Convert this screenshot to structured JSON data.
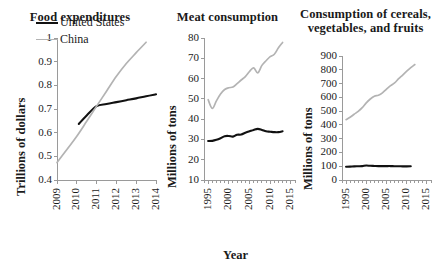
{
  "figure": {
    "background": "#ffffff",
    "series_colors": {
      "united_states": "#111111",
      "china": "#b3b3b3"
    }
  },
  "legend": {
    "position": "inside-panel-1-top-left",
    "entries": [
      {
        "label": "United States",
        "color": "#111111"
      },
      {
        "label": "China",
        "color": "#b3b3b3"
      }
    ]
  },
  "chart_data": [
    {
      "type": "line",
      "title": "Food expenditures",
      "xlabel": "",
      "ylabel": "Trillions of dollars",
      "xlim": [
        2009,
        2014
      ],
      "ylim": [
        0.4,
        1
      ],
      "xticks": [
        "2009",
        "2010",
        "2011",
        "2012",
        "2013",
        "2014"
      ],
      "yticks": [
        "0.4",
        "0.5",
        "0.6",
        "0.7",
        "0.8",
        "0.9",
        "1"
      ],
      "grid": false,
      "legend_position": "upper left",
      "series": [
        {
          "name": "United States",
          "color": "#111111",
          "x": [
            2010.1,
            2010.5,
            2011.0,
            2011.5,
            2012.0,
            2012.5,
            2013.0,
            2013.5,
            2014.0
          ],
          "values": [
            0.637,
            0.673,
            0.712,
            0.721,
            0.729,
            0.737,
            0.745,
            0.754,
            0.762
          ]
        },
        {
          "name": "China",
          "color": "#b3b3b3",
          "x": [
            2009.0,
            2009.5,
            2010.0,
            2010.5,
            2011.0,
            2011.5,
            2012.0,
            2012.5,
            2013.0,
            2013.5
          ],
          "values": [
            0.474,
            0.529,
            0.585,
            0.648,
            0.712,
            0.775,
            0.838,
            0.892,
            0.938,
            0.982
          ]
        }
      ]
    },
    {
      "type": "line",
      "title": "Meat consumption",
      "xlabel": "Year",
      "ylabel": "Millions of tons",
      "xlim": [
        1994,
        2016
      ],
      "ylim": [
        10,
        80
      ],
      "xticks": [
        "1995",
        "2000",
        "2005",
        "2010",
        "2015"
      ],
      "yticks": [
        "10",
        "20",
        "30",
        "40",
        "50",
        "60",
        "70",
        "80"
      ],
      "grid": false,
      "series": [
        {
          "name": "United States",
          "color": "#111111",
          "x": [
            1995,
            1996,
            1997,
            1998,
            1999,
            2000,
            2001,
            2002,
            2003,
            2004,
            2005,
            2006,
            2007,
            2008,
            2009,
            2010,
            2011,
            2012,
            2013
          ],
          "values": [
            29.2,
            29.3,
            29.8,
            30.6,
            31.6,
            31.7,
            31.4,
            32.3,
            32.4,
            33.3,
            34.0,
            34.7,
            35.2,
            34.7,
            34.0,
            33.8,
            33.6,
            33.6,
            34.0
          ]
        },
        {
          "name": "China",
          "color": "#b3b3b3",
          "x": [
            1995,
            1996,
            1997,
            1998,
            1999,
            2000,
            2001,
            2002,
            2003,
            2004,
            2005,
            2006,
            2007,
            2008,
            2009,
            2010,
            2011,
            2012,
            2013
          ],
          "values": [
            49.6,
            45.3,
            49.0,
            52.4,
            54.6,
            55.5,
            55.8,
            57.5,
            59.3,
            61.0,
            63.5,
            65.3,
            62.8,
            66.5,
            68.8,
            70.8,
            72.0,
            75.2,
            77.8
          ]
        }
      ]
    },
    {
      "type": "line",
      "title": "Consumption of cereals, vegetables, and fruits",
      "xlabel": "",
      "ylabel": "Millions of tons",
      "xlim": [
        1994,
        2016
      ],
      "ylim": [
        0,
        900
      ],
      "xticks": [
        "1995",
        "2000",
        "2005",
        "2010",
        "2015"
      ],
      "yticks": [
        "0",
        "100",
        "200",
        "300",
        "400",
        "500",
        "600",
        "700",
        "800",
        "900"
      ],
      "grid": false,
      "series": [
        {
          "name": "United States",
          "color": "#111111",
          "x": [
            1995,
            1996,
            1997,
            1998,
            1999,
            2000,
            2001,
            2002,
            2003,
            2004,
            2005,
            2006,
            2007,
            2008,
            2009,
            2010,
            2011
          ],
          "values": [
            96,
            97,
            99,
            100,
            101,
            105,
            103,
            102,
            101,
            101,
            101,
            101,
            100,
            100,
            99,
            99,
            100
          ]
        },
        {
          "name": "China",
          "color": "#b3b3b3",
          "x": [
            1995,
            1996,
            1997,
            1998,
            1999,
            2000,
            2001,
            2002,
            2003,
            2004,
            2005,
            2006,
            2007,
            2008,
            2009,
            2010,
            2011,
            2012
          ],
          "values": [
            438,
            455,
            477,
            498,
            525,
            560,
            588,
            608,
            615,
            632,
            660,
            685,
            705,
            735,
            762,
            790,
            815,
            838
          ]
        }
      ]
    }
  ]
}
